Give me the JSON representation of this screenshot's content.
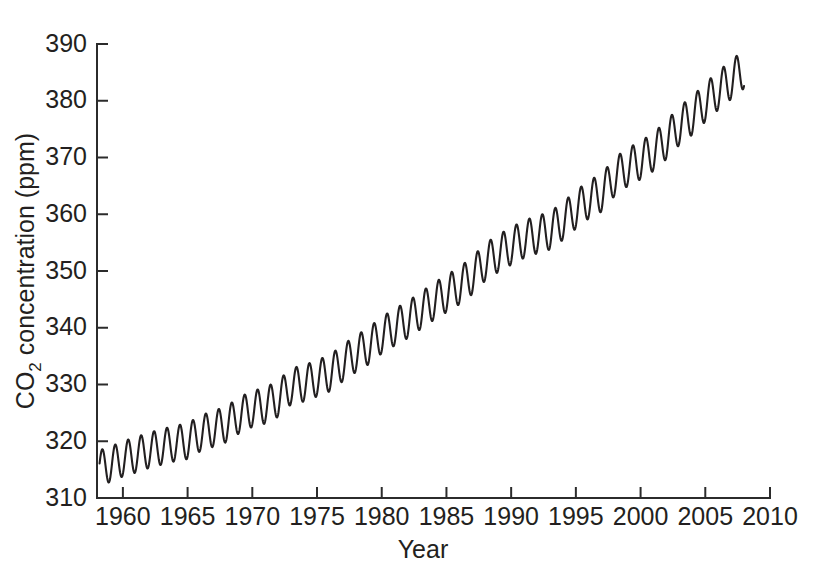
{
  "figure": {
    "background_color": "#ffffff",
    "line_color": "#221f20",
    "axis_color": "#2b2b2b"
  },
  "axes": {
    "y_title_main": "CO",
    "y_title_sub": "2",
    "y_title_rest": " concentration (ppm)",
    "y_title_full": "CO2 concentration (ppm)",
    "x_title": "Year",
    "y_ticks": [
      "310",
      "320",
      "330",
      "340",
      "350",
      "360",
      "370",
      "380",
      "390"
    ],
    "x_ticks": [
      "1960",
      "1965",
      "1970",
      "1975",
      "1980",
      "1985",
      "1990",
      "1995",
      "2000",
      "2005",
      "2010"
    ]
  },
  "chart_data": {
    "type": "line",
    "title": "",
    "xlabel": "Year",
    "ylabel": "CO2 concentration (ppm)",
    "xlim": [
      1958.0,
      2010.0
    ],
    "ylim": [
      310,
      390
    ],
    "xticks": [
      1960,
      1965,
      1970,
      1975,
      1980,
      1985,
      1990,
      1995,
      2000,
      2005,
      2010
    ],
    "yticks": [
      310,
      320,
      330,
      340,
      350,
      360,
      370,
      380,
      390
    ],
    "grid": false,
    "legend": "none",
    "series": [
      {
        "name": "Mauna Loa monthly mean CO2",
        "description": "Keeling curve: rising trend with annual seasonal sawtooth oscillation",
        "trend_start_year": 1958.2,
        "trend_end_year": 2008.0,
        "trend_start_value": 314.5,
        "trend_end_value": 384.0,
        "seasonal_amplitude_start_ppm": 3.0,
        "seasonal_amplitude_end_ppm": 3.3,
        "seasonal_peak_month_fraction": 0.37,
        "annual_means": [
          {
            "year": 1958,
            "value": 315.2
          },
          {
            "year": 1959,
            "value": 315.9
          },
          {
            "year": 1960,
            "value": 316.9
          },
          {
            "year": 1961,
            "value": 317.6
          },
          {
            "year": 1962,
            "value": 318.4
          },
          {
            "year": 1963,
            "value": 319.0
          },
          {
            "year": 1964,
            "value": 319.6
          },
          {
            "year": 1965,
            "value": 320.0
          },
          {
            "year": 1966,
            "value": 321.4
          },
          {
            "year": 1967,
            "value": 322.2
          },
          {
            "year": 1968,
            "value": 323.0
          },
          {
            "year": 1969,
            "value": 324.6
          },
          {
            "year": 1970,
            "value": 325.7
          },
          {
            "year": 1971,
            "value": 326.3
          },
          {
            "year": 1972,
            "value": 327.5
          },
          {
            "year": 1973,
            "value": 329.7
          },
          {
            "year": 1974,
            "value": 330.2
          },
          {
            "year": 1975,
            "value": 331.1
          },
          {
            "year": 1976,
            "value": 332.0
          },
          {
            "year": 1977,
            "value": 333.8
          },
          {
            "year": 1978,
            "value": 335.4
          },
          {
            "year": 1979,
            "value": 336.8
          },
          {
            "year": 1980,
            "value": 338.7
          },
          {
            "year": 1981,
            "value": 340.1
          },
          {
            "year": 1982,
            "value": 341.4
          },
          {
            "year": 1983,
            "value": 343.0
          },
          {
            "year": 1984,
            "value": 344.6
          },
          {
            "year": 1985,
            "value": 346.0
          },
          {
            "year": 1986,
            "value": 347.4
          },
          {
            "year": 1987,
            "value": 349.2
          },
          {
            "year": 1988,
            "value": 351.6
          },
          {
            "year": 1989,
            "value": 353.1
          },
          {
            "year": 1990,
            "value": 354.4
          },
          {
            "year": 1991,
            "value": 355.6
          },
          {
            "year": 1992,
            "value": 356.4
          },
          {
            "year": 1993,
            "value": 357.1
          },
          {
            "year": 1994,
            "value": 358.8
          },
          {
            "year": 1995,
            "value": 360.8
          },
          {
            "year": 1996,
            "value": 362.6
          },
          {
            "year": 1997,
            "value": 363.8
          },
          {
            "year": 1998,
            "value": 366.6
          },
          {
            "year": 1999,
            "value": 368.3
          },
          {
            "year": 2000,
            "value": 369.5
          },
          {
            "year": 2001,
            "value": 371.0
          },
          {
            "year": 2002,
            "value": 373.1
          },
          {
            "year": 2003,
            "value": 375.6
          },
          {
            "year": 2004,
            "value": 377.4
          },
          {
            "year": 2005,
            "value": 379.7
          },
          {
            "year": 2006,
            "value": 381.8
          },
          {
            "year": 2007,
            "value": 383.7
          },
          {
            "year": 2008,
            "value": 385.6
          }
        ]
      }
    ]
  }
}
